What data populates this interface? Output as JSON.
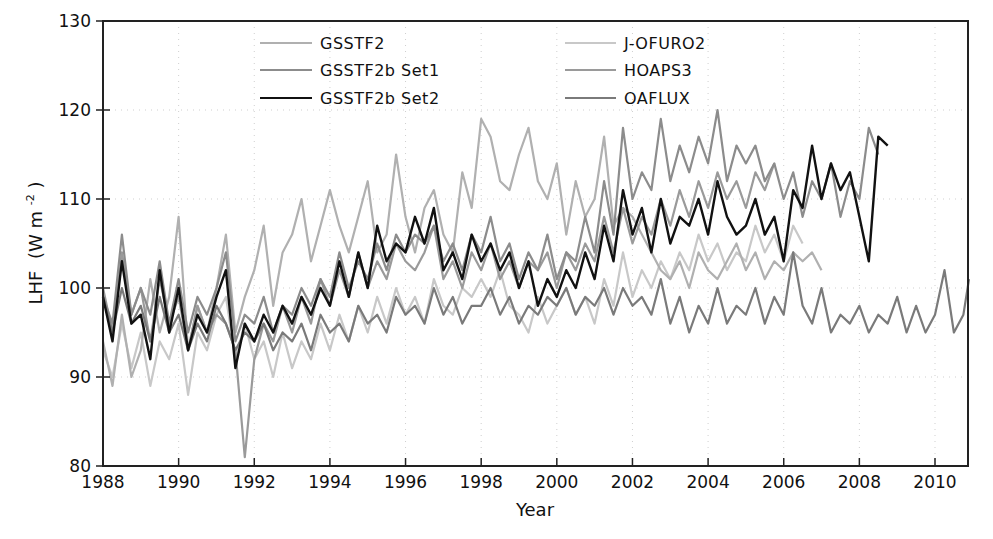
{
  "chart_data": {
    "type": "line",
    "title": "",
    "xlabel": "Year",
    "ylabel": "LHF (W m⁻²)",
    "ylabel_main": "LHF",
    "ylabel_units": "(W m",
    "ylabel_sup": "-2",
    "ylabel_close": ")",
    "xlim": [
      1988,
      2010.9
    ],
    "ylim": [
      80,
      130
    ],
    "xticks": [
      1988,
      1990,
      1992,
      1994,
      1996,
      1998,
      2000,
      2002,
      2004,
      2006,
      2008,
      2010
    ],
    "yticks": [
      80,
      90,
      100,
      110,
      120,
      130
    ],
    "grid": "dotted",
    "legend_position": "top, two columns",
    "series": [
      {
        "name": "GSSTF2",
        "color": "#b0b0b0",
        "width": 2.2,
        "x": [
          1988.0,
          1988.25,
          1988.5,
          1988.75,
          1989.0,
          1989.25,
          1989.5,
          1989.75,
          1990.0,
          1990.25,
          1990.5,
          1990.75,
          1991.0,
          1991.25,
          1991.5,
          1991.75,
          1992.0,
          1992.25,
          1992.5,
          1992.75,
          1993.0,
          1993.25,
          1993.5,
          1993.75,
          1994.0,
          1994.25,
          1994.5,
          1994.75,
          1995.0,
          1995.25,
          1995.5,
          1995.75,
          1996.0,
          1996.25,
          1996.5,
          1996.75,
          1997.0,
          1997.25,
          1997.5,
          1997.75,
          1998.0,
          1998.25,
          1998.5,
          1998.75,
          1999.0,
          1999.25,
          1999.5,
          1999.75,
          2000.0,
          2000.25,
          2000.5,
          2000.75,
          2001.0,
          2001.25,
          2001.5,
          2001.75,
          2002.0,
          2002.25,
          2002.5,
          2002.75,
          2003.0,
          2003.25,
          2003.5,
          2003.75,
          2004.0,
          2004.25,
          2004.5,
          2004.75,
          2005.0,
          2005.25,
          2005.5,
          2005.75,
          2006.0,
          2006.25,
          2006.5,
          2006.75,
          2007.0
        ],
        "values": [
          94,
          89,
          97,
          90,
          93,
          101,
          95,
          99,
          108,
          93,
          98,
          95,
          100,
          106,
          95,
          99,
          102,
          107,
          98,
          104,
          106,
          110,
          103,
          107,
          111,
          107,
          104,
          108,
          112,
          104,
          106,
          115,
          108,
          104,
          109,
          111,
          106,
          104,
          113,
          109,
          119,
          117,
          112,
          111,
          115,
          118,
          112,
          110,
          114,
          106,
          112,
          108,
          110,
          117,
          107,
          109,
          108,
          106,
          104,
          102,
          101,
          103,
          100,
          104,
          102,
          101,
          103,
          105,
          102,
          104,
          101,
          103,
          102,
          104,
          103,
          104,
          102
        ]
      },
      {
        "name": "GSSTF2b Set1",
        "color": "#8c8c8c",
        "width": 2.2,
        "x": [
          1988.0,
          1988.25,
          1988.5,
          1988.75,
          1989.0,
          1989.25,
          1989.5,
          1989.75,
          1990.0,
          1990.25,
          1990.5,
          1990.75,
          1991.0,
          1991.25,
          1991.5,
          1991.75,
          1992.0,
          1992.25,
          1992.5,
          1992.75,
          1993.0,
          1993.25,
          1993.5,
          1993.75,
          1994.0,
          1994.25,
          1994.5,
          1994.75,
          1995.0,
          1995.25,
          1995.5,
          1995.75,
          1996.0,
          1996.25,
          1996.5,
          1996.75,
          1997.0,
          1997.25,
          1997.5,
          1997.75,
          1998.0,
          1998.25,
          1998.5,
          1998.75,
          1999.0,
          1999.25,
          1999.5,
          1999.75,
          2000.0,
          2000.25,
          2000.5,
          2000.75,
          2001.0,
          2001.25,
          2001.5,
          2001.75,
          2002.0,
          2002.25,
          2002.5,
          2002.75,
          2003.0,
          2003.25,
          2003.5,
          2003.75,
          2004.0,
          2004.25,
          2004.5,
          2004.75,
          2005.0,
          2005.25,
          2005.5,
          2005.75,
          2006.0,
          2006.25,
          2006.5,
          2006.75,
          2007.0,
          2007.25,
          2007.5,
          2007.75,
          2008.0,
          2008.25,
          2008.5
        ],
        "values": [
          99,
          96,
          106,
          97,
          100,
          97,
          103,
          96,
          101,
          95,
          99,
          97,
          100,
          104,
          94,
          97,
          96,
          99,
          95,
          98,
          97,
          100,
          98,
          101,
          99,
          104,
          100,
          103,
          101,
          105,
          102,
          106,
          104,
          106,
          105,
          107,
          103,
          105,
          102,
          106,
          104,
          108,
          103,
          105,
          101,
          104,
          102,
          106,
          101,
          104,
          103,
          108,
          104,
          112,
          106,
          118,
          110,
          113,
          111,
          119,
          112,
          116,
          113,
          117,
          114,
          120,
          112,
          116,
          114,
          116,
          112,
          114,
          110,
          113,
          108,
          112,
          110,
          114,
          108,
          112,
          110,
          118,
          115
        ]
      },
      {
        "name": "GSSTF2b Set2",
        "color": "#111111",
        "width": 2.4,
        "x": [
          1988.0,
          1988.25,
          1988.5,
          1988.75,
          1989.0,
          1989.25,
          1989.5,
          1989.75,
          1990.0,
          1990.25,
          1990.5,
          1990.75,
          1991.0,
          1991.25,
          1991.5,
          1991.75,
          1992.0,
          1992.25,
          1992.5,
          1992.75,
          1993.0,
          1993.25,
          1993.5,
          1993.75,
          1994.0,
          1994.25,
          1994.5,
          1994.75,
          1995.0,
          1995.25,
          1995.5,
          1995.75,
          1996.0,
          1996.25,
          1996.5,
          1996.75,
          1997.0,
          1997.25,
          1997.5,
          1997.75,
          1998.0,
          1998.25,
          1998.5,
          1998.75,
          1999.0,
          1999.25,
          1999.5,
          1999.75,
          2000.0,
          2000.25,
          2000.5,
          2000.75,
          2001.0,
          2001.25,
          2001.5,
          2001.75,
          2002.0,
          2002.25,
          2002.5,
          2002.75,
          2003.0,
          2003.25,
          2003.5,
          2003.75,
          2004.0,
          2004.25,
          2004.5,
          2004.75,
          2005.0,
          2005.25,
          2005.5,
          2005.75,
          2006.0,
          2006.25,
          2006.5,
          2006.75,
          2007.0,
          2007.25,
          2007.5,
          2007.75,
          2008.0,
          2008.25,
          2008.5,
          2008.75
        ],
        "values": [
          99,
          94,
          103,
          96,
          97,
          92,
          102,
          95,
          100,
          93,
          97,
          95,
          99,
          102,
          91,
          96,
          94,
          97,
          95,
          98,
          96,
          99,
          97,
          100,
          98,
          103,
          99,
          104,
          100,
          107,
          103,
          105,
          104,
          108,
          105,
          109,
          102,
          104,
          101,
          106,
          103,
          105,
          102,
          104,
          100,
          103,
          98,
          101,
          99,
          102,
          100,
          104,
          101,
          107,
          103,
          111,
          106,
          109,
          104,
          110,
          105,
          108,
          107,
          110,
          106,
          112,
          108,
          106,
          107,
          110,
          106,
          108,
          103,
          111,
          109,
          116,
          110,
          114,
          111,
          113,
          108,
          103,
          117,
          116
        ]
      },
      {
        "name": "J-OFURO2",
        "color": "#c8c8c8",
        "width": 2.2,
        "x": [
          1988.0,
          1988.25,
          1988.5,
          1988.75,
          1989.0,
          1989.25,
          1989.5,
          1989.75,
          1990.0,
          1990.25,
          1990.5,
          1990.75,
          1991.0,
          1991.25,
          1991.5,
          1991.75,
          1992.0,
          1992.25,
          1992.5,
          1992.75,
          1993.0,
          1993.25,
          1993.5,
          1993.75,
          1994.0,
          1994.25,
          1994.5,
          1994.75,
          1995.0,
          1995.25,
          1995.5,
          1995.75,
          1996.0,
          1996.25,
          1996.5,
          1996.75,
          1997.0,
          1997.25,
          1997.5,
          1997.75,
          1998.0,
          1998.25,
          1998.5,
          1998.75,
          1999.0,
          1999.25,
          1999.5,
          1999.75,
          2000.0,
          2000.25,
          2000.5,
          2000.75,
          2001.0,
          2001.25,
          2001.5,
          2001.75,
          2002.0,
          2002.25,
          2002.5,
          2002.75,
          2003.0,
          2003.25,
          2003.5,
          2003.75,
          2004.0,
          2004.25,
          2004.5,
          2004.75,
          2005.0,
          2005.25,
          2005.5,
          2005.75,
          2006.0,
          2006.25,
          2006.5
        ],
        "values": [
          93,
          90,
          96,
          91,
          95,
          89,
          94,
          92,
          96,
          88,
          95,
          93,
          97,
          99,
          92,
          96,
          92,
          94,
          90,
          95,
          91,
          94,
          92,
          96,
          93,
          97,
          94,
          98,
          95,
          99,
          96,
          100,
          97,
          99,
          96,
          101,
          98,
          97,
          100,
          99,
          101,
          99,
          102,
          98,
          97,
          95,
          99,
          96,
          98,
          100,
          97,
          99,
          96,
          101,
          98,
          104,
          99,
          102,
          100,
          103,
          101,
          104,
          102,
          106,
          103,
          105,
          102,
          104,
          103,
          107,
          104,
          106,
          103,
          107,
          105
        ]
      },
      {
        "name": "HOAPS3",
        "color": "#9a9a9a",
        "width": 2.2,
        "x": [
          1988.0,
          1988.25,
          1988.5,
          1988.75,
          1989.0,
          1989.25,
          1989.5,
          1989.75,
          1990.0,
          1990.25,
          1990.5,
          1990.75,
          1991.0,
          1991.25,
          1991.5,
          1991.75,
          1992.0,
          1992.25,
          1992.5,
          1992.75,
          1993.0,
          1993.25,
          1993.5,
          1993.75,
          1994.0,
          1994.25,
          1994.5,
          1994.75,
          1995.0,
          1995.25,
          1995.5,
          1995.75,
          1996.0,
          1996.25,
          1996.5,
          1996.75,
          1997.0,
          1997.25,
          1997.5,
          1997.75,
          1998.0,
          1998.25,
          1998.5,
          1998.75,
          1999.0,
          1999.25,
          1999.5,
          1999.75,
          2000.0,
          2000.25,
          2000.5,
          2000.75,
          2001.0,
          2001.25,
          2001.5,
          2001.75,
          2002.0,
          2002.25,
          2002.5,
          2002.75,
          2003.0,
          2003.25,
          2003.5,
          2003.75,
          2004.0,
          2004.25,
          2004.5,
          2004.75,
          2005.0,
          2005.25,
          2005.5,
          2005.75
        ],
        "values": [
          100,
          95,
          104,
          97,
          100,
          94,
          101,
          96,
          99,
          93,
          98,
          95,
          97,
          96,
          93,
          81,
          92,
          96,
          94,
          98,
          95,
          99,
          96,
          101,
          98,
          102,
          99,
          104,
          100,
          103,
          101,
          105,
          103,
          102,
          104,
          107,
          101,
          103,
          100,
          104,
          102,
          105,
          101,
          103,
          100,
          103,
          102,
          104,
          100,
          104,
          102,
          105,
          103,
          108,
          104,
          109,
          105,
          108,
          106,
          110,
          107,
          111,
          108,
          112,
          109,
          113,
          110,
          112,
          109,
          113,
          111,
          114
        ]
      },
      {
        "name": "OAFLUX",
        "color": "#7a7a7a",
        "width": 2.2,
        "x": [
          1988.0,
          1988.25,
          1988.5,
          1988.75,
          1989.0,
          1989.25,
          1989.5,
          1989.75,
          1990.0,
          1990.25,
          1990.5,
          1990.75,
          1991.0,
          1991.25,
          1991.5,
          1991.75,
          1992.0,
          1992.25,
          1992.5,
          1992.75,
          1993.0,
          1993.25,
          1993.5,
          1993.75,
          1994.0,
          1994.25,
          1994.5,
          1994.75,
          1995.0,
          1995.25,
          1995.5,
          1995.75,
          1996.0,
          1996.25,
          1996.5,
          1996.75,
          1997.0,
          1997.25,
          1997.5,
          1997.75,
          1998.0,
          1998.25,
          1998.5,
          1998.75,
          1999.0,
          1999.25,
          1999.5,
          1999.75,
          2000.0,
          2000.25,
          2000.5,
          2000.75,
          2001.0,
          2001.25,
          2001.5,
          2001.75,
          2002.0,
          2002.25,
          2002.5,
          2002.75,
          2003.0,
          2003.25,
          2003.5,
          2003.75,
          2004.0,
          2004.25,
          2004.5,
          2004.75,
          2005.0,
          2005.25,
          2005.5,
          2005.75,
          2006.0,
          2006.25,
          2006.5,
          2006.75,
          2007.0,
          2007.25,
          2007.5,
          2007.75,
          2008.0,
          2008.25,
          2008.5,
          2008.75,
          2009.0,
          2009.25,
          2009.5,
          2009.75,
          2010.0,
          2010.25,
          2010.5,
          2010.75,
          2010.9
        ],
        "values": [
          99,
          95,
          100,
          96,
          98,
          94,
          99,
          95,
          97,
          93,
          96,
          94,
          98,
          96,
          93,
          95,
          94,
          96,
          93,
          95,
          94,
          96,
          93,
          97,
          95,
          96,
          94,
          98,
          96,
          97,
          95,
          99,
          97,
          98,
          96,
          100,
          97,
          99,
          96,
          98,
          98,
          100,
          97,
          99,
          96,
          98,
          97,
          99,
          98,
          100,
          97,
          99,
          98,
          100,
          97,
          100,
          98,
          99,
          97,
          101,
          96,
          99,
          95,
          98,
          96,
          100,
          96,
          98,
          97,
          100,
          96,
          99,
          97,
          104,
          98,
          96,
          100,
          95,
          97,
          96,
          98,
          95,
          97,
          96,
          99,
          95,
          98,
          95,
          97,
          102,
          95,
          97,
          101
        ]
      }
    ]
  },
  "legend": {
    "left": [
      "GSSTF2",
      "GSSTF2b Set1",
      "GSSTF2b Set2"
    ],
    "right": [
      "J-OFURO2",
      "HOAPS3",
      "OAFLUX"
    ]
  }
}
